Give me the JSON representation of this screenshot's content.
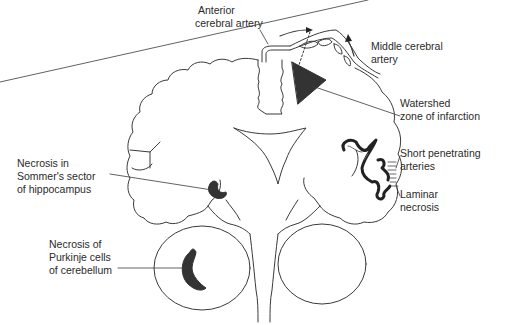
{
  "figure": {
    "colors": {
      "line": "#3a3a3a",
      "lesion": "#333333",
      "background": "#ffffff"
    }
  },
  "labels": {
    "anterior_cerebral_artery": {
      "line1": "Anterior",
      "line2": "cerebral artery"
    },
    "middle_cerebral_artery": {
      "line1": "Middle cerebral",
      "line2": "artery"
    },
    "watershed_zone": {
      "line1": "Watershed",
      "line2": "zone of infarction"
    },
    "short_penetrating_arteries": {
      "line1": "Short penetrating",
      "line2": "arteries"
    },
    "laminar_necrosis": {
      "line1": "Laminar",
      "line2": "necrosis"
    },
    "sommer_sector": {
      "line1": "Necrosis in",
      "line2": "Sommer's sector",
      "line3": "of hippocampus"
    },
    "purkinje_cells": {
      "line1": "Necrosis of",
      "line2": "Purkinje cells",
      "line3": "of cerebellum"
    }
  }
}
